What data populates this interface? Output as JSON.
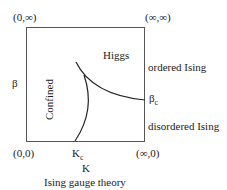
{
  "diagram": {
    "caption": "Ising gauge theory",
    "corners": {
      "top_left": "(0,∞)",
      "top_right": "(∞,∞)",
      "bottom_left": "(0,0)",
      "bottom_right": "(∞,0)"
    },
    "axes": {
      "x_label": "K",
      "y_label": "β",
      "x_critical": "K",
      "x_critical_sub": "c",
      "y_critical": "β",
      "y_critical_sub": "c"
    },
    "regions": {
      "higgs": "Higgs",
      "confined": "Confined"
    },
    "right_labels": {
      "ordered": "ordered Ising",
      "disordered": "disordered Ising"
    }
  }
}
